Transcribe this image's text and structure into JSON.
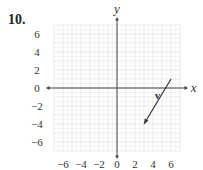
{
  "problem_number": "10.",
  "chart_data": {
    "type": "scatter",
    "title": "",
    "xlabel": "x",
    "ylabel": "y",
    "xlim": [
      -7,
      7
    ],
    "ylim": [
      -7,
      7
    ],
    "x_ticks": [
      "-6",
      "-4",
      "-2",
      "0",
      "2",
      "4",
      "6"
    ],
    "y_ticks": [
      "6",
      "4",
      "2",
      "0",
      "-2",
      "-4",
      "-6"
    ],
    "grid": true,
    "vectors": [
      {
        "name": "v",
        "tail": [
          6,
          1
        ],
        "head": [
          3,
          -4
        ]
      }
    ]
  },
  "labels": {
    "x_axis": "x",
    "y_axis": "y",
    "vector": "v"
  }
}
